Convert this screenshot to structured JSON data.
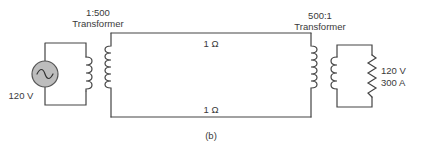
{
  "figure": {
    "caption": "(b)",
    "source": {
      "label": "120 V",
      "type": "ac-source"
    },
    "step_up_transformer": {
      "ratio": "1:500",
      "label": "Transformer"
    },
    "line": {
      "top_resistance": "1 Ω",
      "bottom_resistance": "1 Ω"
    },
    "step_down_transformer": {
      "ratio": "500:1",
      "label": "Transformer"
    },
    "load": {
      "voltage": "120 V",
      "current": "300 A",
      "type": "resistor"
    }
  }
}
